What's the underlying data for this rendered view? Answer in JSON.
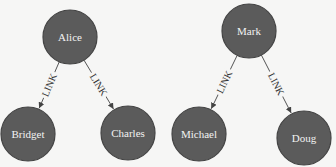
{
  "diagram": {
    "type": "graph",
    "background": "#f6f6f5",
    "node_color": "#5b5b5b",
    "node_text_color": "#f2f2f2",
    "edge_color": "#555555",
    "nodes": [
      {
        "id": "alice",
        "label": "Alice",
        "cx": 70,
        "cy": 37,
        "r": 27
      },
      {
        "id": "bridget",
        "label": "Bridget",
        "cx": 28,
        "cy": 134,
        "r": 27
      },
      {
        "id": "charles",
        "label": "Charles",
        "cx": 128,
        "cy": 133,
        "r": 27
      },
      {
        "id": "mark",
        "label": "Mark",
        "cx": 249,
        "cy": 31,
        "r": 27
      },
      {
        "id": "michael",
        "label": "Michael",
        "cx": 199,
        "cy": 134,
        "r": 27
      },
      {
        "id": "doug",
        "label": "Doug",
        "cx": 304,
        "cy": 138,
        "r": 27
      }
    ],
    "edges": [
      {
        "from": "alice",
        "to": "bridget",
        "label": "LINK"
      },
      {
        "from": "alice",
        "to": "charles",
        "label": "LINK"
      },
      {
        "from": "mark",
        "to": "michael",
        "label": "LINK"
      },
      {
        "from": "mark",
        "to": "doug",
        "label": "LINK"
      }
    ]
  }
}
